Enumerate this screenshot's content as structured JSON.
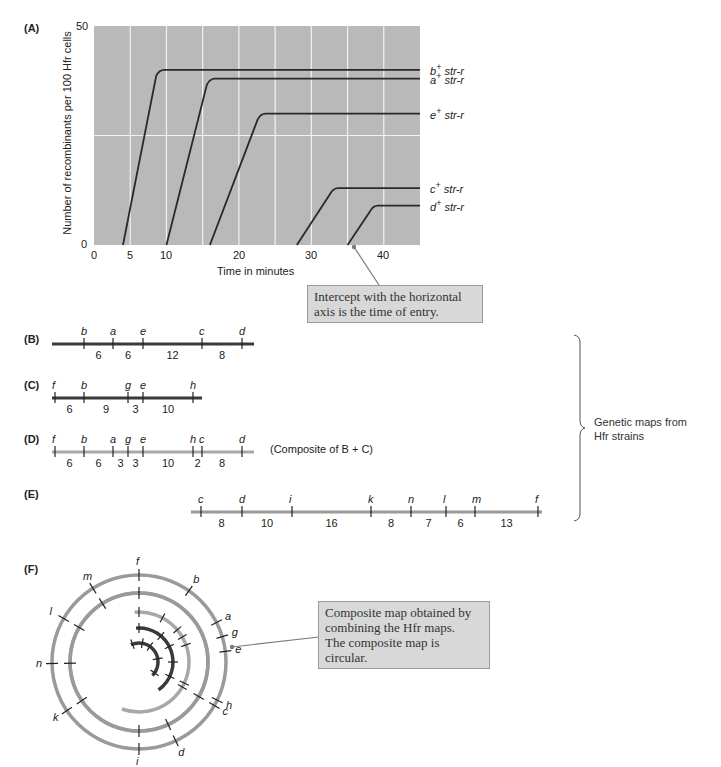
{
  "panels": {
    "A": "(A)",
    "B": "(B)",
    "C": "(C)",
    "D": "(D)",
    "E": "(E)",
    "F": "(F)"
  },
  "chart_data": {
    "type": "line",
    "title": "",
    "xlabel": "Time in minutes",
    "ylabel": "Number of recombinants per 100 Hfr cells",
    "xlim": [
      0,
      45
    ],
    "ylim": [
      0,
      50
    ],
    "x_ticks": [
      "0",
      "5",
      "10",
      "20",
      "30",
      "40"
    ],
    "y_ticks": [
      "0",
      "50"
    ],
    "grid": true,
    "legend_position": "right end of each line",
    "series": [
      {
        "name": "b+ str-r",
        "gene": "b",
        "sup": "+",
        "marker": "str-r",
        "entry_time": 4,
        "plateau_time": 9,
        "plateau": 40
      },
      {
        "name": "a+ str-r",
        "gene": "a",
        "sup": "+",
        "marker": "str-r",
        "entry_time": 10,
        "plateau_time": 16,
        "plateau": 38
      },
      {
        "name": "e+ str-r",
        "gene": "e",
        "sup": "+",
        "marker": "str-r",
        "entry_time": 16,
        "plateau_time": 23,
        "plateau": 30
      },
      {
        "name": "c+ str-r",
        "gene": "c",
        "sup": "+",
        "marker": "str-r",
        "entry_time": 28,
        "plateau_time": 33,
        "plateau": 13
      },
      {
        "name": "d+ str-r",
        "gene": "d",
        "sup": "+",
        "marker": "str-r",
        "entry_time": 35,
        "plateau_time": 38.5,
        "plateau": 9
      }
    ]
  },
  "callouts": {
    "intercept": "Intercept with the horizontal axis is the time of entry.",
    "intercept_line1": "Intercept with the horizontal",
    "intercept_line2": "axis is the time of entry.",
    "composite_line1": "Composite map obtained by",
    "composite_line2": "combining the Hfr maps.",
    "composite_line3": "The composite map is circular."
  },
  "maps": {
    "B": {
      "genes": [
        "b",
        "a",
        "e",
        "c",
        "d"
      ],
      "distances": [
        "6",
        "6",
        "12",
        "8"
      ]
    },
    "C": {
      "genes": [
        "f",
        "b",
        "g",
        "e",
        "h"
      ],
      "distances": [
        "6",
        "9",
        "3",
        "10"
      ]
    },
    "D": {
      "genes": [
        "f",
        "b",
        "a",
        "g",
        "e",
        "h",
        "c",
        "d"
      ],
      "distances": [
        "6",
        "6",
        "3",
        "3",
        "10",
        "2",
        "8"
      ],
      "note": "(Composite of B + C)"
    },
    "E": {
      "genes": [
        "c",
        "d",
        "i",
        "k",
        "n",
        "l",
        "m",
        "f"
      ],
      "distances": [
        "8",
        "10",
        "16",
        "8",
        "7",
        "6",
        "13"
      ]
    }
  },
  "bracket_label_line1": "Genetic maps from",
  "bracket_label_line2": "Hfr strains",
  "circular_map": {
    "genes": [
      "f",
      "b",
      "a",
      "g",
      "e",
      "h",
      "c",
      "d",
      "i",
      "k",
      "n",
      "l",
      "m"
    ]
  },
  "colors": {
    "plot_bg": "#b9b9b9",
    "grid": "#f2f2f2",
    "curve": "#2a2a2a",
    "map_dark": "#3a3a3a",
    "map_light": "#9a9a9a",
    "map_lighter": "#a8a8a8",
    "callout_bg": "#d8d8d8"
  }
}
